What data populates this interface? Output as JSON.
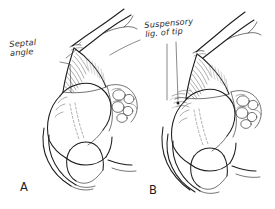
{
  "figure": {
    "background_color": "#ffffff",
    "ink_color": "#1c1c1c",
    "width": 275,
    "height": 209,
    "medium": "pen-and-ink line drawing"
  },
  "annotations": [
    {
      "id": "septal-angle",
      "line1": "Septal",
      "line2": "angle",
      "full_text": "Septal angle",
      "panel": "A",
      "leader_target_x": 76,
      "leader_target_y": 47
    },
    {
      "id": "suspensory-ligament",
      "line1": "Suspensory",
      "line2": "lig. of tip",
      "full_text": "Suspensory lig. of tip",
      "panel": "B",
      "leader_target_x": 178,
      "leader_target_y": 103
    }
  ],
  "panels": [
    {
      "id": "panel-a",
      "letter": "A",
      "caption": "A",
      "description": "Profile view of nasal cartilage framework showing septal angle"
    },
    {
      "id": "panel-b",
      "letter": "B",
      "caption": "B",
      "description": "Profile view of nasal cartilage framework showing suspensory ligament of the tip"
    }
  ]
}
